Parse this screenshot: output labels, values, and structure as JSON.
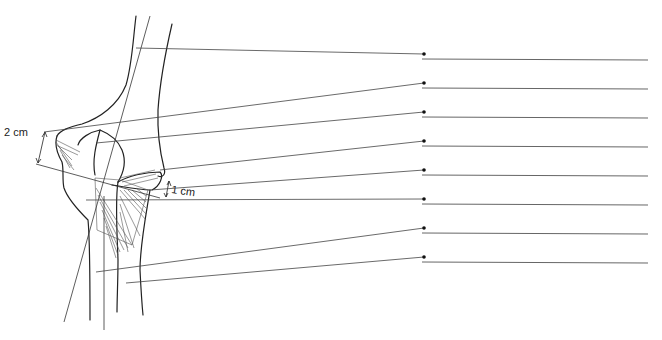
{
  "figure": {
    "measurements": [
      {
        "id": "upper",
        "text": "2 cm"
      },
      {
        "id": "lower",
        "text": "1 cm"
      }
    ],
    "labels": [
      {
        "index": 1,
        "text": ""
      },
      {
        "index": 2,
        "text": ""
      },
      {
        "index": 3,
        "text": ""
      },
      {
        "index": 4,
        "text": ""
      },
      {
        "index": 5,
        "text": ""
      },
      {
        "index": 6,
        "text": ""
      },
      {
        "index": 7,
        "text": ""
      },
      {
        "index": 8,
        "text": ""
      }
    ],
    "colors": {
      "line": "#222222",
      "leader": "#444444",
      "answer_line": "#666666"
    }
  }
}
